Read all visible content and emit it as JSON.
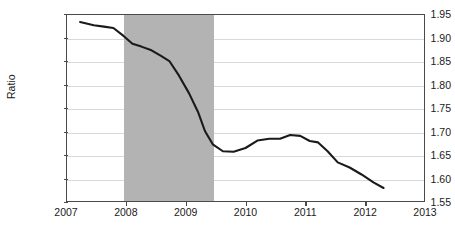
{
  "chart_data": {
    "type": "line",
    "title": "",
    "subtitle": "",
    "xlabel": "",
    "ylabel": "Ratio",
    "xlim": [
      2007,
      2013
    ],
    "ylim": [
      1.55,
      1.95
    ],
    "xticks": [
      "2007",
      "2008",
      "2009",
      "2010",
      "2011",
      "2012",
      "2013"
    ],
    "xtick_values": [
      2007,
      2008,
      2009,
      2010,
      2011,
      2012,
      2013
    ],
    "yticks": [
      "1.55",
      "1.60",
      "1.65",
      "1.70",
      "1.75",
      "1.80",
      "1.85",
      "1.90",
      "1.95"
    ],
    "ytick_values": [
      1.55,
      1.6,
      1.65,
      1.7,
      1.75,
      1.8,
      1.85,
      1.9,
      1.95
    ],
    "grid": "horizontal",
    "legend": "none",
    "line_color": "#1a1a1a",
    "shaded_region_color": "#b3b3b3",
    "shaded_regions": [
      {
        "name": "recession-band",
        "x_start": 2007.95,
        "x_end": 2009.45
      }
    ],
    "series": [
      {
        "name": "Ratio",
        "x": [
          2007.22,
          2007.45,
          2007.62,
          2007.78,
          2007.95,
          2008.1,
          2008.25,
          2008.42,
          2008.58,
          2008.72,
          2008.88,
          2009.05,
          2009.2,
          2009.32,
          2009.45,
          2009.62,
          2009.8,
          2010.0,
          2010.2,
          2010.4,
          2010.58,
          2010.75,
          2010.92,
          2011.08,
          2011.22,
          2011.38,
          2011.55,
          2011.75,
          2011.95,
          2012.15,
          2012.32
        ],
        "values": [
          1.935,
          1.928,
          1.925,
          1.922,
          1.905,
          1.888,
          1.882,
          1.874,
          1.862,
          1.851,
          1.82,
          1.782,
          1.742,
          1.7,
          1.672,
          1.657,
          1.656,
          1.664,
          1.68,
          1.684,
          1.684,
          1.692,
          1.69,
          1.679,
          1.676,
          1.657,
          1.633,
          1.622,
          1.607,
          1.59,
          1.578
        ]
      }
    ]
  }
}
